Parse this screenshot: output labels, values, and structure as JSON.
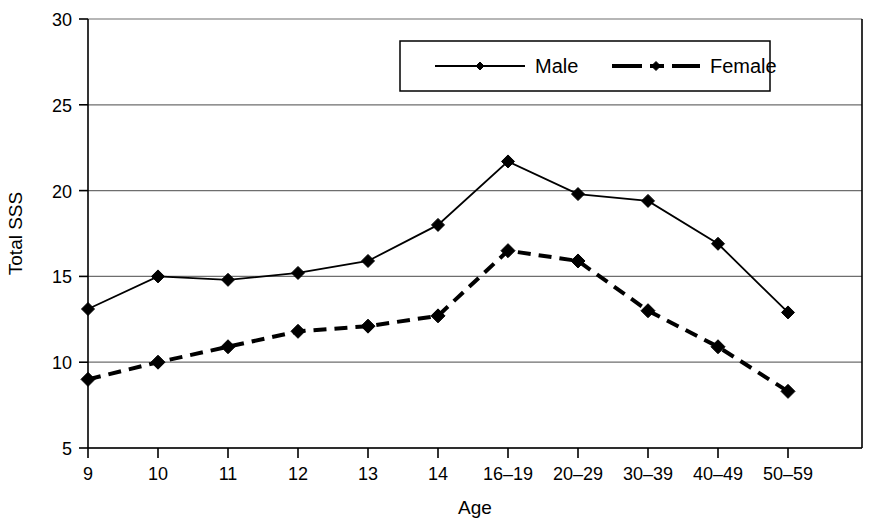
{
  "chart_data": {
    "type": "line",
    "title": "",
    "xlabel": "Age",
    "ylabel": "Total SSS",
    "categories": [
      "9",
      "10",
      "11",
      "12",
      "13",
      "14",
      "16–19",
      "20–29",
      "30–39",
      "40–49",
      "50–59"
    ],
    "ylim": [
      5,
      30
    ],
    "yticks": [
      5,
      10,
      15,
      20,
      25,
      30
    ],
    "ytick_labels": [
      "5",
      "10",
      "15",
      "20",
      "25",
      "30"
    ],
    "grid": "horizontal",
    "legend_position": "top-center",
    "series": [
      {
        "name": "Male",
        "line_style": "solid",
        "marker": "diamond",
        "color": "#000000",
        "values": [
          13.1,
          15.0,
          14.8,
          15.2,
          15.9,
          18.0,
          21.7,
          19.8,
          19.4,
          16.9,
          12.9
        ]
      },
      {
        "name": "Female",
        "line_style": "dashed",
        "marker": "diamond",
        "color": "#000000",
        "values": [
          9.0,
          10.0,
          10.9,
          11.8,
          12.1,
          12.7,
          16.5,
          15.9,
          13.0,
          10.9,
          8.3
        ]
      }
    ]
  },
  "legend": {
    "items": [
      {
        "label": "Male"
      },
      {
        "label": "Female"
      }
    ]
  },
  "colors": {
    "axis": "#000000",
    "grid": "#6e6e6e",
    "series": "#000000",
    "background": "#ffffff"
  }
}
